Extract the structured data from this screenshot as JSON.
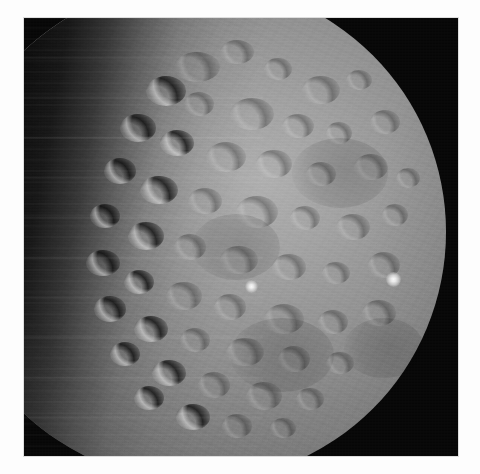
{
  "page": {
    "background_color": "#fdfdfd",
    "width": 480,
    "height": 474
  },
  "photo": {
    "frame_background": "#060606",
    "frame_left": 24,
    "frame_top": 18,
    "frame_width": 434,
    "frame_height": 438,
    "subject": "cratered-dwarf-planet",
    "color_mode": "grayscale",
    "illumination": "sunlit-from-right, terminator-on-left",
    "surface_base_color": "#8c8c8c",
    "highlight_color": "#fdfdfd",
    "shadow_color": "#060606"
  },
  "disk": {
    "center_x_in_frame": 172,
    "center_y_in_frame": 214,
    "radius": 250,
    "lit_fraction_label": "gibbous"
  },
  "bright_spots": [
    {
      "name": "bright-spot-center",
      "x": 221,
      "y": 262,
      "size": 13
    },
    {
      "name": "bright-spot-east",
      "x": 362,
      "y": 254,
      "size": 15
    }
  ],
  "craters": [
    {
      "x": 150,
      "y": 34,
      "w": 46,
      "h": 30,
      "style": "lit"
    },
    {
      "x": 196,
      "y": 22,
      "w": 34,
      "h": 24,
      "style": "lit"
    },
    {
      "x": 240,
      "y": 40,
      "w": 28,
      "h": 22,
      "style": "lit"
    },
    {
      "x": 278,
      "y": 58,
      "w": 38,
      "h": 28,
      "style": "lit"
    },
    {
      "x": 322,
      "y": 52,
      "w": 26,
      "h": 20,
      "style": "lit"
    },
    {
      "x": 122,
      "y": 58,
      "w": 40,
      "h": 30,
      "style": "term"
    },
    {
      "x": 160,
      "y": 74,
      "w": 30,
      "h": 24,
      "style": "lit"
    },
    {
      "x": 206,
      "y": 80,
      "w": 44,
      "h": 32,
      "style": "lit"
    },
    {
      "x": 258,
      "y": 96,
      "w": 32,
      "h": 24,
      "style": "lit"
    },
    {
      "x": 302,
      "y": 104,
      "w": 26,
      "h": 22,
      "style": "lit"
    },
    {
      "x": 346,
      "y": 92,
      "w": 30,
      "h": 24,
      "style": "lit"
    },
    {
      "x": 96,
      "y": 96,
      "w": 36,
      "h": 28,
      "style": "term"
    },
    {
      "x": 136,
      "y": 112,
      "w": 34,
      "h": 26,
      "style": "term"
    },
    {
      "x": 182,
      "y": 124,
      "w": 40,
      "h": 30,
      "style": "lit"
    },
    {
      "x": 232,
      "y": 132,
      "w": 36,
      "h": 28,
      "style": "lit"
    },
    {
      "x": 282,
      "y": 144,
      "w": 30,
      "h": 24,
      "style": "lit"
    },
    {
      "x": 330,
      "y": 136,
      "w": 34,
      "h": 26,
      "style": "lit"
    },
    {
      "x": 372,
      "y": 150,
      "w": 24,
      "h": 20,
      "style": "lit"
    },
    {
      "x": 80,
      "y": 140,
      "w": 32,
      "h": 26,
      "style": "term"
    },
    {
      "x": 116,
      "y": 158,
      "w": 38,
      "h": 28,
      "style": "term"
    },
    {
      "x": 164,
      "y": 170,
      "w": 34,
      "h": 26,
      "style": "lit"
    },
    {
      "x": 212,
      "y": 178,
      "w": 42,
      "h": 32,
      "style": "lit"
    },
    {
      "x": 266,
      "y": 188,
      "w": 30,
      "h": 24,
      "style": "lit"
    },
    {
      "x": 312,
      "y": 196,
      "w": 34,
      "h": 26,
      "style": "lit"
    },
    {
      "x": 358,
      "y": 186,
      "w": 26,
      "h": 22,
      "style": "lit"
    },
    {
      "x": 66,
      "y": 186,
      "w": 30,
      "h": 24,
      "style": "term"
    },
    {
      "x": 104,
      "y": 204,
      "w": 36,
      "h": 28,
      "style": "term"
    },
    {
      "x": 150,
      "y": 216,
      "w": 32,
      "h": 26,
      "style": "lit"
    },
    {
      "x": 196,
      "y": 228,
      "w": 38,
      "h": 28,
      "style": "lit"
    },
    {
      "x": 248,
      "y": 236,
      "w": 34,
      "h": 26,
      "style": "lit"
    },
    {
      "x": 298,
      "y": 244,
      "w": 28,
      "h": 22,
      "style": "lit"
    },
    {
      "x": 344,
      "y": 234,
      "w": 32,
      "h": 26,
      "style": "lit"
    },
    {
      "x": 62,
      "y": 232,
      "w": 34,
      "h": 26,
      "style": "term"
    },
    {
      "x": 100,
      "y": 252,
      "w": 30,
      "h": 24,
      "style": "term"
    },
    {
      "x": 142,
      "y": 264,
      "w": 36,
      "h": 28,
      "style": "lit"
    },
    {
      "x": 190,
      "y": 276,
      "w": 32,
      "h": 26,
      "style": "lit"
    },
    {
      "x": 240,
      "y": 286,
      "w": 40,
      "h": 30,
      "style": "lit"
    },
    {
      "x": 294,
      "y": 292,
      "w": 30,
      "h": 24,
      "style": "lit"
    },
    {
      "x": 338,
      "y": 282,
      "w": 34,
      "h": 26,
      "style": "lit"
    },
    {
      "x": 70,
      "y": 278,
      "w": 32,
      "h": 26,
      "style": "term"
    },
    {
      "x": 110,
      "y": 298,
      "w": 34,
      "h": 26,
      "style": "term"
    },
    {
      "x": 156,
      "y": 310,
      "w": 30,
      "h": 24,
      "style": "lit"
    },
    {
      "x": 202,
      "y": 320,
      "w": 38,
      "h": 28,
      "style": "lit"
    },
    {
      "x": 254,
      "y": 328,
      "w": 32,
      "h": 26,
      "style": "lit"
    },
    {
      "x": 302,
      "y": 334,
      "w": 28,
      "h": 22,
      "style": "lit"
    },
    {
      "x": 86,
      "y": 324,
      "w": 30,
      "h": 24,
      "style": "term"
    },
    {
      "x": 128,
      "y": 342,
      "w": 34,
      "h": 26,
      "style": "term"
    },
    {
      "x": 174,
      "y": 354,
      "w": 32,
      "h": 26,
      "style": "lit"
    },
    {
      "x": 222,
      "y": 364,
      "w": 36,
      "h": 28,
      "style": "lit"
    },
    {
      "x": 272,
      "y": 370,
      "w": 28,
      "h": 22,
      "style": "lit"
    },
    {
      "x": 110,
      "y": 368,
      "w": 30,
      "h": 24,
      "style": "term"
    },
    {
      "x": 152,
      "y": 386,
      "w": 34,
      "h": 26,
      "style": "term"
    },
    {
      "x": 198,
      "y": 396,
      "w": 30,
      "h": 24,
      "style": "lit"
    },
    {
      "x": 246,
      "y": 400,
      "w": 26,
      "h": 20,
      "style": "lit"
    },
    {
      "x": 168,
      "y": 196,
      "w": 88,
      "h": 66,
      "style": "basin"
    },
    {
      "x": 268,
      "y": 120,
      "w": 96,
      "h": 70,
      "style": "basin"
    },
    {
      "x": 206,
      "y": 300,
      "w": 104,
      "h": 74,
      "style": "basin"
    },
    {
      "x": 320,
      "y": 300,
      "w": 80,
      "h": 60,
      "style": "basin"
    }
  ]
}
